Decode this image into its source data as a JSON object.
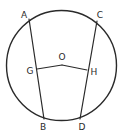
{
  "diagram": {
    "type": "geometry-circle-chords",
    "background": "#ffffff",
    "stroke_color": "#2a2a2a",
    "circle": {
      "cx": 61.5,
      "cy": 65.5,
      "r": 55
    },
    "points": {
      "A": {
        "x": 29,
        "y": 19,
        "label": "A",
        "lx": 24,
        "ly": 15
      },
      "B": {
        "x": 44,
        "y": 119,
        "label": "B",
        "lx": 43,
        "ly": 127
      },
      "C": {
        "x": 97,
        "y": 21,
        "label": "C",
        "lx": 100,
        "ly": 15
      },
      "D": {
        "x": 80,
        "y": 119,
        "label": "D",
        "lx": 82,
        "ly": 127
      },
      "G": {
        "x": 37,
        "y": 69,
        "label": "G",
        "lx": 30,
        "ly": 71
      },
      "H": {
        "x": 87,
        "y": 70,
        "label": "H",
        "lx": 94,
        "ly": 72
      },
      "O": {
        "x": 62,
        "y": 65,
        "label": "O",
        "lx": 62,
        "ly": 57
      }
    },
    "segments": [
      {
        "from": "A",
        "to": "B",
        "name": "chord-AB"
      },
      {
        "from": "C",
        "to": "D",
        "name": "chord-CD"
      },
      {
        "from": "G",
        "to": "O",
        "name": "segment-GO"
      },
      {
        "from": "O",
        "to": "H",
        "name": "segment-OH"
      }
    ]
  }
}
